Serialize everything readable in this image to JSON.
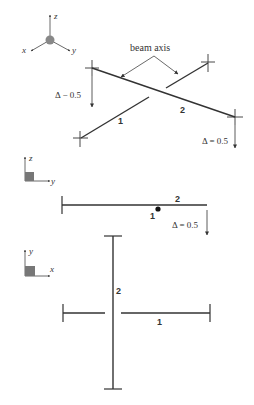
{
  "iso_view": {
    "axes": {
      "x": "x",
      "y": "y",
      "z": "z"
    },
    "annotation": "beam axis",
    "beam1_label": "1",
    "beam2_label": "2",
    "delta_left": "Δ − 0.5",
    "delta_right": "Δ = 0.5"
  },
  "side_view": {
    "axes": {
      "vertical": "z",
      "horizontal": "y"
    },
    "beam2_label": "2",
    "beam1_label": "1",
    "delta": "Δ = 0.5"
  },
  "top_view": {
    "axes": {
      "vertical": "y",
      "horizontal": "x"
    },
    "beam2_label": "2",
    "beam1_label": "1"
  },
  "colors": {
    "line": "#333333",
    "axis_box": "#777777"
  }
}
